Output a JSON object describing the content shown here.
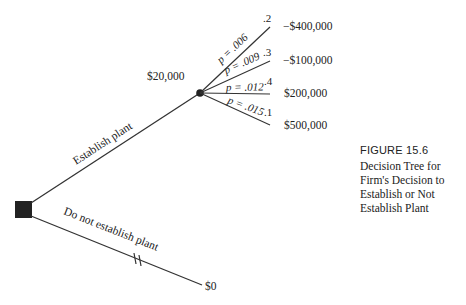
{
  "figure": {
    "label": "FIGURE 15.6",
    "caption": "Decision Tree for Firm's Decision to Establish or Not Establish Plant"
  },
  "tree": {
    "decision_node": {
      "shape": "square",
      "color": "#222222"
    },
    "branches": {
      "establish": {
        "label": "Establish plant"
      },
      "not_establish": {
        "label": "Do not establish plant",
        "payoff": "$0",
        "pruned_marker": "||"
      }
    },
    "chance_node": {
      "value": "$20,000",
      "outcomes": [
        {
          "label": "p = .006",
          "probability": ".2",
          "payoff": "−$400,000"
        },
        {
          "label": "p = .009",
          "probability": ".3",
          "payoff": "−$100,000"
        },
        {
          "label": "p = .012",
          "probability": ".4",
          "payoff": "$200,000"
        },
        {
          "label": "p = .015",
          "probability": ".1",
          "payoff": "$500,000"
        }
      ]
    }
  },
  "colors": {
    "line": "#333333",
    "text": "#222222",
    "background": "#ffffff"
  }
}
